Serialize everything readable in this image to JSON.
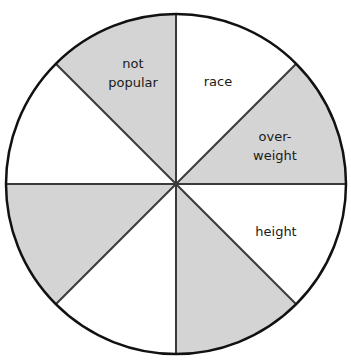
{
  "diagram": {
    "type": "segmented-circle",
    "segments_count": 8,
    "colors": {
      "shaded": "#d4d4d4",
      "unshaded": "#ffffff",
      "stroke": "#3a3a3a",
      "outline": "#111111"
    },
    "segments": [
      {
        "index": 0,
        "position": "top-right",
        "shaded": false,
        "label_lines": [
          "race"
        ]
      },
      {
        "index": 1,
        "position": "right-upper",
        "shaded": true,
        "label_lines": [
          "over-",
          "weight"
        ]
      },
      {
        "index": 2,
        "position": "right-lower",
        "shaded": false,
        "label_lines": [
          "height"
        ]
      },
      {
        "index": 3,
        "position": "bottom-right",
        "shaded": true,
        "label_lines": []
      },
      {
        "index": 4,
        "position": "bottom-left",
        "shaded": false,
        "label_lines": []
      },
      {
        "index": 5,
        "position": "left-lower",
        "shaded": true,
        "label_lines": []
      },
      {
        "index": 6,
        "position": "left-upper",
        "shaded": false,
        "label_lines": []
      },
      {
        "index": 7,
        "position": "top-left",
        "shaded": true,
        "label_lines": [
          "not",
          "popular"
        ]
      }
    ],
    "labels": {
      "race": "race",
      "overweight_1": "over-",
      "overweight_2": "weight",
      "height": "height",
      "not_popular_1": "not",
      "not_popular_2": "popular"
    }
  }
}
